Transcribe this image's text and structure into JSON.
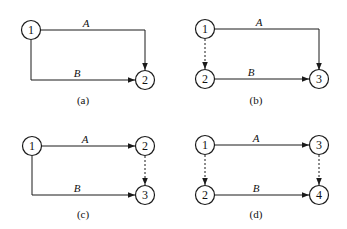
{
  "diagrams": [
    {
      "caption": "(a)",
      "nodes": [
        {
          "id": "1",
          "label": "1"
        },
        {
          "id": "2",
          "label": "2"
        }
      ],
      "activities": [
        {
          "label": "A",
          "from": "1",
          "to": "2",
          "type": "solid"
        },
        {
          "label": "B",
          "from": "1",
          "to": "2",
          "type": "solid"
        }
      ]
    },
    {
      "caption": "(b)",
      "nodes": [
        {
          "id": "1",
          "label": "1"
        },
        {
          "id": "2",
          "label": "2"
        },
        {
          "id": "3",
          "label": "3"
        }
      ],
      "activities": [
        {
          "label": "A",
          "from": "1",
          "to": "3",
          "type": "solid"
        },
        {
          "label": "",
          "from": "1",
          "to": "2",
          "type": "dummy"
        },
        {
          "label": "B",
          "from": "2",
          "to": "3",
          "type": "solid"
        }
      ]
    },
    {
      "caption": "(c)",
      "nodes": [
        {
          "id": "1",
          "label": "1"
        },
        {
          "id": "2",
          "label": "2"
        },
        {
          "id": "3",
          "label": "3"
        }
      ],
      "activities": [
        {
          "label": "A",
          "from": "1",
          "to": "2",
          "type": "solid"
        },
        {
          "label": "",
          "from": "2",
          "to": "3",
          "type": "dummy"
        },
        {
          "label": "B",
          "from": "1",
          "to": "3",
          "type": "solid"
        }
      ]
    },
    {
      "caption": "(d)",
      "nodes": [
        {
          "id": "1",
          "label": "1"
        },
        {
          "id": "2",
          "label": "2"
        },
        {
          "id": "3",
          "label": "3"
        },
        {
          "id": "4",
          "label": "4"
        }
      ],
      "activities": [
        {
          "label": "A",
          "from": "1",
          "to": "3",
          "type": "solid"
        },
        {
          "label": "",
          "from": "1",
          "to": "2",
          "type": "dummy"
        },
        {
          "label": "",
          "from": "3",
          "to": "4",
          "type": "dummy"
        },
        {
          "label": "B",
          "from": "2",
          "to": "4",
          "type": "solid"
        }
      ]
    }
  ],
  "colors": {
    "line": "#1a1a1a",
    "background": "#ffffff"
  }
}
